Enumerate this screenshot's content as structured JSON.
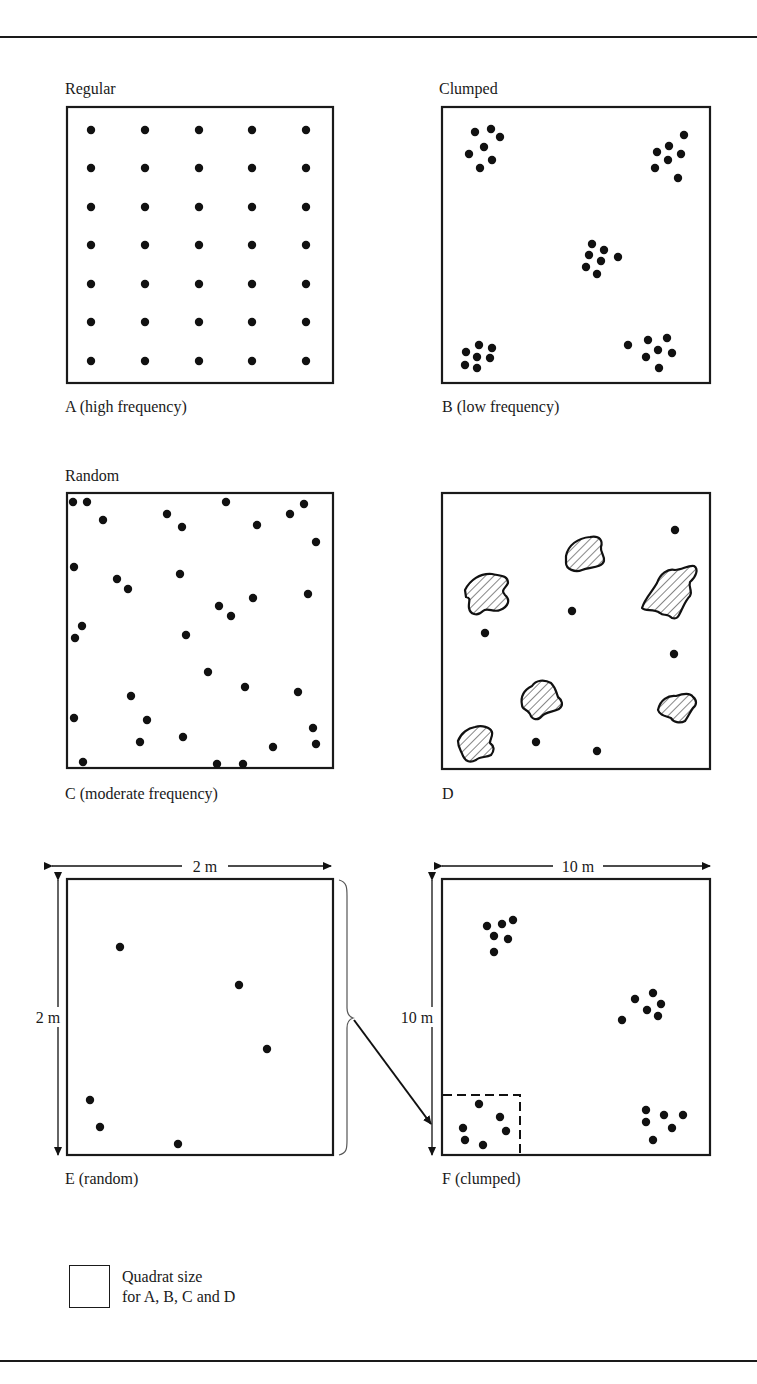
{
  "figure": {
    "panels": [
      {
        "id": "A",
        "heading": "Regular",
        "caption": "A (high frequency)",
        "frame": {
          "x": 67,
          "y": 107,
          "w": 266,
          "h": 276
        },
        "pattern": "regular",
        "grid": {
          "cols": [
            91,
            145,
            199,
            252,
            306
          ],
          "rows": [
            130,
            168,
            207,
            245,
            284,
            322,
            361
          ]
        }
      },
      {
        "id": "B",
        "heading": "Clumped",
        "caption": "B (low frequency)",
        "frame": {
          "x": 442,
          "y": 107,
          "w": 268,
          "h": 276
        },
        "pattern": "clumped",
        "dots": [
          [
            475,
            132
          ],
          [
            491,
            129
          ],
          [
            500,
            137
          ],
          [
            484,
            147
          ],
          [
            469,
            154
          ],
          [
            492,
            160
          ],
          [
            480,
            168
          ],
          [
            684,
            135
          ],
          [
            669,
            146
          ],
          [
            657,
            152
          ],
          [
            681,
            154
          ],
          [
            668,
            160
          ],
          [
            655,
            168
          ],
          [
            678,
            178
          ],
          [
            592,
            244
          ],
          [
            604,
            250
          ],
          [
            589,
            255
          ],
          [
            601,
            261
          ],
          [
            618,
            257
          ],
          [
            586,
            267
          ],
          [
            597,
            274
          ],
          [
            479,
            345
          ],
          [
            492,
            348
          ],
          [
            466,
            352
          ],
          [
            477,
            357
          ],
          [
            490,
            358
          ],
          [
            465,
            365
          ],
          [
            477,
            368
          ],
          [
            628,
            345
          ],
          [
            648,
            340
          ],
          [
            667,
            338
          ],
          [
            658,
            350
          ],
          [
            672,
            353
          ],
          [
            646,
            357
          ],
          [
            659,
            368
          ]
        ]
      },
      {
        "id": "C",
        "heading": "Random",
        "caption": "C (moderate frequency)",
        "frame": {
          "x": 67,
          "y": 493,
          "w": 266,
          "h": 275
        },
        "pattern": "random",
        "dots": [
          [
            73,
            502
          ],
          [
            87,
            502
          ],
          [
            103,
            520
          ],
          [
            167,
            514
          ],
          [
            182,
            527
          ],
          [
            226,
            502
          ],
          [
            257,
            525
          ],
          [
            290,
            514
          ],
          [
            304,
            504
          ],
          [
            316,
            542
          ],
          [
            74,
            567
          ],
          [
            117,
            579
          ],
          [
            128,
            589
          ],
          [
            180,
            574
          ],
          [
            219,
            606
          ],
          [
            231,
            616
          ],
          [
            253,
            598
          ],
          [
            308,
            594
          ],
          [
            82,
            626
          ],
          [
            75,
            638
          ],
          [
            186,
            635
          ],
          [
            208,
            672
          ],
          [
            245,
            687
          ],
          [
            298,
            692
          ],
          [
            131,
            696
          ],
          [
            147,
            720
          ],
          [
            74,
            718
          ],
          [
            140,
            742
          ],
          [
            183,
            737
          ],
          [
            273,
            747
          ],
          [
            313,
            728
          ],
          [
            316,
            744
          ],
          [
            83,
            762
          ],
          [
            217,
            764
          ],
          [
            243,
            764
          ]
        ]
      },
      {
        "id": "D",
        "heading": "",
        "caption": "D",
        "frame": {
          "x": 442,
          "y": 493,
          "w": 268,
          "h": 276
        },
        "pattern": "patches",
        "dots": [
          [
            675,
            530
          ],
          [
            572,
            611
          ],
          [
            485,
            633
          ],
          [
            674,
            654
          ],
          [
            536,
            742
          ],
          [
            597,
            751
          ]
        ],
        "patches": [
          "M465,590 C470,580 480,573 492,574 C500,576 508,575 508,583 C506,588 500,590 505,595 C511,600 508,607 500,610 C494,613 487,607 483,611 C477,617 470,614 469,608 C468,602 472,598 466,597 Z",
          "M566,556 C568,545 578,538 590,537 C600,535 603,541 601,547 C600,552 605,556 604,561 C602,568 590,567 582,570 C575,573 566,569 566,563 Z",
          "M642,608 C645,598 652,592 657,583 C660,574 668,568 675,570 C682,570 688,565 694,566 C699,569 696,577 690,582 C688,588 693,590 690,596 C686,600 684,605 682,609 C679,615 678,620 672,618 C666,612 664,617 660,613 C653,608 646,612 642,608 Z",
          "M522,705 C520,695 526,689 532,686 C536,680 544,679 551,683 C556,688 556,692 558,697 C562,700 564,705 559,709 C553,712 545,712 542,716 C538,721 532,720 530,714 C526,708 522,710 522,705 Z",
          "M658,710 C660,700 668,695 676,696 C682,694 690,692 693,697 C697,700 697,705 693,708 C690,712 688,717 685,721 C680,724 673,722 671,718 C666,716 660,716 658,710 Z",
          "M458,741 C461,733 468,728 475,727 C482,725 490,727 492,732 C493,736 490,739 490,743 C494,746 495,750 491,755 C486,758 480,756 476,760 C470,763 466,762 463,756 C461,750 458,748 458,741 Z"
        ]
      },
      {
        "id": "E",
        "heading": "",
        "caption": "E (random)",
        "frame": {
          "x": 67,
          "y": 879,
          "w": 266,
          "h": 276
        },
        "pattern": "random",
        "dimension_label_top": "2 m",
        "dimension_label_side": "2 m",
        "dots": [
          [
            120,
            947
          ],
          [
            239,
            985
          ],
          [
            267,
            1049
          ],
          [
            90,
            1100
          ],
          [
            100,
            1127
          ],
          [
            178,
            1144
          ]
        ]
      },
      {
        "id": "F",
        "heading": "",
        "caption": "F (clumped)",
        "frame": {
          "x": 442,
          "y": 879,
          "w": 268,
          "h": 276
        },
        "pattern": "clumped",
        "dimension_label_top": "10 m",
        "dimension_label_side": "10 m",
        "dots": [
          [
            487,
            926
          ],
          [
            502,
            924
          ],
          [
            513,
            920
          ],
          [
            494,
            936
          ],
          [
            508,
            939
          ],
          [
            494,
            952
          ],
          [
            635,
            999
          ],
          [
            653,
            993
          ],
          [
            661,
            1004
          ],
          [
            647,
            1010
          ],
          [
            658,
            1016
          ],
          [
            622,
            1020
          ],
          [
            479,
            1104
          ],
          [
            500,
            1117
          ],
          [
            463,
            1128
          ],
          [
            506,
            1131
          ],
          [
            465,
            1140
          ],
          [
            483,
            1145
          ],
          [
            646,
            1110
          ],
          [
            664,
            1115
          ],
          [
            683,
            1115
          ],
          [
            646,
            1122
          ],
          [
            672,
            1128
          ],
          [
            653,
            1140
          ]
        ],
        "inset_quadrat": {
          "x": 442,
          "y": 1095,
          "w": 78,
          "h": 60
        }
      }
    ],
    "legend": {
      "line1": "Quadrat size",
      "line2": "for A, B, C and D"
    }
  }
}
